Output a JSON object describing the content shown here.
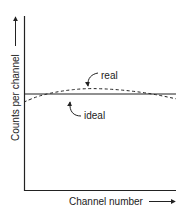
{
  "chart_data": {
    "type": "line",
    "title": "",
    "xlabel": "Channel number",
    "ylabel": "Counts per channel",
    "x_range": [
      0,
      1
    ],
    "y_range": [
      0,
      1
    ],
    "grid": false,
    "series": [
      {
        "name": "ideal",
        "style": "solid",
        "x": [
          0,
          1
        ],
        "y": [
          0.6,
          0.6
        ]
      },
      {
        "name": "real",
        "style": "dashed",
        "x": [
          0,
          0.1,
          0.25,
          0.4,
          0.55,
          0.7,
          0.85,
          1.0
        ],
        "y": [
          0.55,
          0.59,
          0.62,
          0.635,
          0.632,
          0.62,
          0.6,
          0.57
        ]
      }
    ],
    "annotations": [
      {
        "text": "real",
        "points_to": "real"
      },
      {
        "text": "ideal",
        "points_to": "ideal"
      }
    ]
  },
  "colors": {
    "ink": "#222222",
    "background": "#ffffff"
  }
}
